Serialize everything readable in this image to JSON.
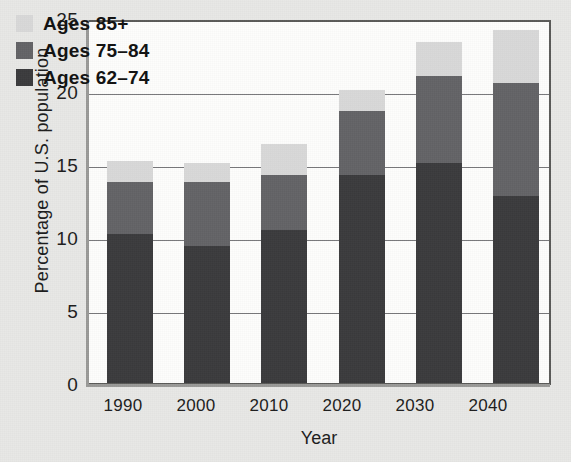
{
  "chart_data": {
    "type": "bar",
    "stacked": true,
    "title": "",
    "xlabel": "Year",
    "ylabel": "Percentage of U.S. population",
    "categories": [
      "1990",
      "2000",
      "2010",
      "2020",
      "2030",
      "2040"
    ],
    "ylim": [
      0,
      25
    ],
    "yticks": [
      0,
      5,
      10,
      15,
      20,
      25
    ],
    "ytick_labels": [
      "0",
      "5",
      "10",
      "15",
      "20",
      "25"
    ],
    "grid": true,
    "grid_axis": "y",
    "legend_position": "top-left",
    "series": [
      {
        "name": "Ages 62–74",
        "color": "#3b3b3d",
        "values": [
          10.2,
          9.4,
          10.5,
          14.25,
          15.1,
          12.8
        ]
      },
      {
        "name": "Ages 75–84",
        "color": "#636366",
        "values": [
          3.6,
          4.4,
          3.75,
          4.35,
          5.9,
          7.75
        ]
      },
      {
        "name": "Ages 85+",
        "color": "#d9d9d9",
        "values": [
          1.4,
          1.3,
          2.15,
          1.5,
          2.35,
          3.65
        ]
      }
    ],
    "totals": [
      15.2,
      15.1,
      16.4,
      20.1,
      23.35,
      24.2
    ],
    "legend_entries": [
      {
        "label": "Ages 85+",
        "color": "#d9d9d9"
      },
      {
        "label": "Ages 75–84",
        "color": "#636366"
      },
      {
        "label": "Ages 62–74",
        "color": "#3b3b3d"
      }
    ]
  },
  "colors": {
    "background": "#e8e8e6",
    "plot_background": "#fdfdfc",
    "axis": "#5a5a58",
    "gridline": "#77777a",
    "text": "#1c1c1c"
  }
}
